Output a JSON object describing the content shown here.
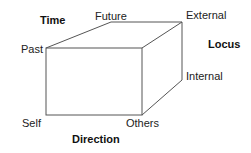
{
  "diagram": {
    "type": "cube",
    "axes": {
      "time": "Time",
      "locus": "Locus",
      "direction": "Direction"
    },
    "vertex_labels": {
      "past": "Past",
      "future": "Future",
      "external": "External",
      "internal": "Internal",
      "self": "Self",
      "others": "Others"
    },
    "line_color": "#555555"
  }
}
